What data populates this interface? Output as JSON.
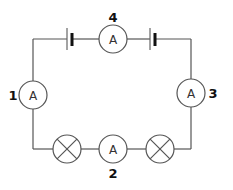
{
  "diagram": {
    "type": "series circuit",
    "colors": {
      "wire": "#555555",
      "label": "#111111",
      "background": "#ffffff"
    },
    "ammeter_symbol": "A",
    "ammeters": [
      {
        "id": "1",
        "label": "1",
        "symbol": "A",
        "position": "left side"
      },
      {
        "id": "2",
        "label": "2",
        "symbol": "A",
        "position": "bottom, between lamps"
      },
      {
        "id": "3",
        "label": "3",
        "symbol": "A",
        "position": "right side"
      },
      {
        "id": "4",
        "label": "4",
        "symbol": "A",
        "position": "top, between cells"
      }
    ],
    "cells": [
      {
        "id": "cell-left",
        "position": "top-left"
      },
      {
        "id": "cell-right",
        "position": "top-right"
      }
    ],
    "lamps": [
      {
        "id": "lamp-left",
        "position": "bottom-left"
      },
      {
        "id": "lamp-right",
        "position": "bottom-right"
      }
    ]
  }
}
